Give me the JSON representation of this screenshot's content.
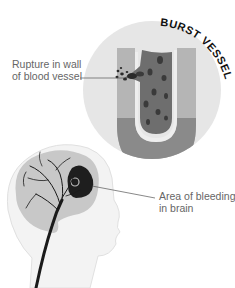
{
  "diagram": {
    "title_arc": "BURST VESSEL",
    "labels": {
      "rupture": {
        "line1": "Rupture in wall",
        "line2": "of blood vessel"
      },
      "bleeding": {
        "line1": "Area of bleeding",
        "line2": "in brain"
      }
    },
    "colors": {
      "circle_bg": "#e6e6e6",
      "vessel_wall": "#8a8a8a",
      "vessel_wall_light": "#b8b8b8",
      "vessel_lumen": "#6e6e6e",
      "blood_cell": "#3a3a3a",
      "head_outline": "#f2f2f2",
      "brain": "#c8c8c8",
      "bleed_area": "#1e1e1e",
      "artery": "#1a1a1a",
      "label_text": "#666666"
    }
  }
}
